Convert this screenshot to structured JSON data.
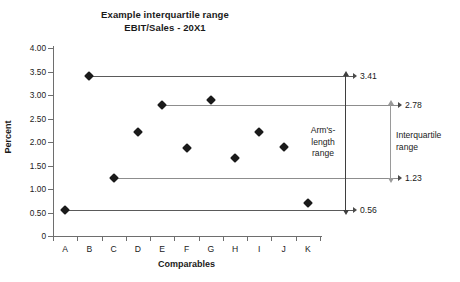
{
  "chart_data": {
    "type": "scatter",
    "title": "Example interquartile range",
    "subtitle": "EBIT/Sales - 20X1",
    "xlabel": "Comparables",
    "ylabel": "Percent",
    "grid": false,
    "legend": "none",
    "ylim": [
      0,
      4.0
    ],
    "ytick_labels": [
      "4.00",
      "3.50",
      "3.00",
      "2.50",
      "2.00",
      "1.50",
      "1.00",
      "0.50",
      "0"
    ],
    "ytick_values": [
      4.0,
      3.5,
      3.0,
      2.5,
      2.0,
      1.5,
      1.0,
      0.5,
      0
    ],
    "categories": [
      "A",
      "B",
      "C",
      "D",
      "E",
      "F",
      "G",
      "H",
      "I",
      "J",
      "K"
    ],
    "values": [
      0.56,
      3.41,
      1.23,
      2.21,
      2.78,
      1.88,
      2.9,
      1.66,
      2.21,
      1.9,
      0.71
    ],
    "points": [
      {
        "label": "A",
        "value": 0.56
      },
      {
        "label": "B",
        "value": 3.41
      },
      {
        "label": "C",
        "value": 1.23
      },
      {
        "label": "D",
        "value": 2.21
      },
      {
        "label": "E",
        "value": 2.78
      },
      {
        "label": "F",
        "value": 1.88
      },
      {
        "label": "G",
        "value": 2.9
      },
      {
        "label": "H",
        "value": 1.66
      },
      {
        "label": "I",
        "value": 2.21
      },
      {
        "label": "J",
        "value": 1.9
      },
      {
        "label": "K",
        "value": 0.71
      }
    ],
    "reference_lines": [
      {
        "name": "maximum",
        "from_category": "B",
        "value": 3.41,
        "label": "3.41"
      },
      {
        "name": "upper-quartile",
        "from_category": "E",
        "value": 2.78,
        "label": "2.78"
      },
      {
        "name": "lower-quartile",
        "from_category": "C",
        "value": 1.23,
        "label": "1.23"
      },
      {
        "name": "minimum",
        "from_category": "A",
        "value": 0.56,
        "label": "0.56"
      }
    ],
    "range_annotations": [
      {
        "name": "arms-length-range",
        "label_lines": [
          "Arm's-",
          "length",
          "range"
        ],
        "upper": 3.41,
        "lower": 0.56
      },
      {
        "name": "interquartile-range",
        "label_lines": [
          "Interquartile",
          "range"
        ],
        "upper": 2.78,
        "lower": 1.23
      }
    ],
    "colors": {
      "marker": "#1a1a1a",
      "axis": "#6e6e6e",
      "reference_line": "#8d8d8d",
      "arms_length_bar": "#3f3f3f",
      "interquartile_bar": "#9a9a9a",
      "background": "#ffffff"
    }
  }
}
